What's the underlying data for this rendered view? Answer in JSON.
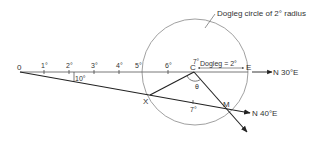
{
  "diagram": {
    "title_note": "Dogleg circle of 2° radius",
    "points": {
      "origin": "0",
      "center": "C",
      "end": "E",
      "x_point": "X",
      "m_point": "M"
    },
    "course_labels": {
      "upper": "N 30°E",
      "lower": "N 40°E"
    },
    "tick_labels": [
      "1°",
      "2°",
      "3°",
      "4°",
      "5°",
      "6°",
      "7°"
    ],
    "lower_tick_label": "7°",
    "angle_label": "10°",
    "theta_label": "θ",
    "dogleg_label": "Dogleg = 2°",
    "colors": {
      "line": "#222222",
      "circle": "#888888",
      "text": "#333333",
      "background": "#ffffff"
    }
  }
}
